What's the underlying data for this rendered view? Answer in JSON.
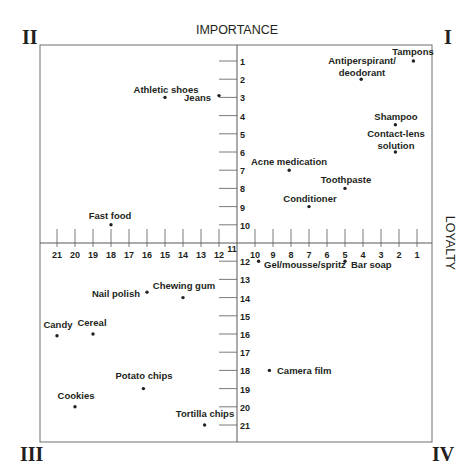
{
  "chart_data": {
    "type": "scatter",
    "title": "",
    "quadrant_labels": [
      "I",
      "II",
      "III",
      "IV"
    ],
    "ylabel": "IMPORTANCE",
    "xlabel": "LOYALTY",
    "x_axis": {
      "name": "LOYALTY",
      "ticks_right": [
        10,
        9,
        8,
        7,
        6,
        5,
        4,
        3,
        2,
        1
      ],
      "ticks_left": [
        21,
        20,
        19,
        18,
        17,
        16,
        15,
        14,
        13,
        12
      ],
      "center_label": "11",
      "direction": "higher loyalty toward right (1 = highest)"
    },
    "y_axis": {
      "name": "IMPORTANCE",
      "ticks_top": [
        1,
        2,
        3,
        4,
        5,
        6,
        7,
        8,
        9,
        10
      ],
      "ticks_bottom": [
        12,
        13,
        14,
        15,
        16,
        17,
        18,
        19,
        20,
        21
      ],
      "center_label": "11",
      "direction": "higher importance toward top (1 = highest)"
    },
    "grid": false,
    "legend": null,
    "points": [
      {
        "label": "Tampons",
        "loyalty": 1.2,
        "importance": 1,
        "quadrant": "I"
      },
      {
        "label": "Antiperspirant/ deodorant",
        "loyalty": 4.1,
        "importance": 2,
        "quadrant": "I"
      },
      {
        "label": "Shampoo",
        "loyalty": 2.2,
        "importance": 4.5,
        "quadrant": "I"
      },
      {
        "label": "Contact-lens solution",
        "loyalty": 2.2,
        "importance": 6,
        "quadrant": "I"
      },
      {
        "label": "Acne medication",
        "loyalty": 8.1,
        "importance": 7,
        "quadrant": "I"
      },
      {
        "label": "Toothpaste",
        "loyalty": 5,
        "importance": 8,
        "quadrant": "I"
      },
      {
        "label": "Conditioner",
        "loyalty": 7,
        "importance": 9,
        "quadrant": "I"
      },
      {
        "label": "Athletic shoes",
        "loyalty": 15,
        "importance": 3,
        "quadrant": "II"
      },
      {
        "label": "Jeans",
        "loyalty": 12,
        "importance": 2.9,
        "quadrant": "II"
      },
      {
        "label": "Fast food",
        "loyalty": 18,
        "importance": 10,
        "quadrant": "II"
      },
      {
        "label": "Nail polish",
        "loyalty": 16,
        "importance": 13.7,
        "quadrant": "III"
      },
      {
        "label": "Chewing gum",
        "loyalty": 14,
        "importance": 14,
        "quadrant": "III"
      },
      {
        "label": "Candy",
        "loyalty": 21,
        "importance": 16.1,
        "quadrant": "III"
      },
      {
        "label": "Cereal",
        "loyalty": 19,
        "importance": 16,
        "quadrant": "III"
      },
      {
        "label": "Potato chips",
        "loyalty": 16.2,
        "importance": 19,
        "quadrant": "III"
      },
      {
        "label": "Cookies",
        "loyalty": 20,
        "importance": 20,
        "quadrant": "III"
      },
      {
        "label": "Tortilla chips",
        "loyalty": 12.8,
        "importance": 21,
        "quadrant": "III"
      },
      {
        "label": "Gel/mousse/spritz",
        "loyalty": 9.8,
        "importance": 12,
        "quadrant": "IV"
      },
      {
        "label": "Bar soap",
        "loyalty": 5,
        "importance": 12,
        "quadrant": "IV"
      },
      {
        "label": "Camera film",
        "loyalty": 9.2,
        "importance": 18,
        "quadrant": "IV"
      }
    ]
  },
  "render": {
    "frame": {
      "left": 40,
      "top": 45,
      "right": 432,
      "bottom": 442
    },
    "origin": {
      "x": 237,
      "y": 243
    },
    "step_x": 18,
    "step_y": 18.2,
    "quadrants": [
      {
        "text": "I",
        "x": 444,
        "y": 44
      },
      {
        "text": "II",
        "x": 22,
        "y": 44
      },
      {
        "text": "III",
        "x": 20,
        "y": 461
      },
      {
        "text": "IV",
        "x": 432,
        "y": 461
      }
    ],
    "axis_titles": {
      "importance": {
        "text": "IMPORTANCE",
        "x": 237,
        "y": 34
      },
      "loyalty": {
        "text": "LOYALTY",
        "x": 446,
        "y": 243
      }
    },
    "labels": [
      {
        "lines": [
          "Tampons"
        ],
        "x": 413,
        "y": 55,
        "anchor": "middle"
      },
      {
        "lines": [
          "Antiperspirant/",
          "deodorant"
        ],
        "x": 362,
        "y": 64,
        "anchor": "middle"
      },
      {
        "lines": [
          "Shampoo"
        ],
        "x": 396,
        "y": 120,
        "anchor": "middle"
      },
      {
        "lines": [
          "Contact-lens",
          "solution"
        ],
        "x": 396,
        "y": 137,
        "anchor": "middle"
      },
      {
        "lines": [
          "Acne medication"
        ],
        "x": 289,
        "y": 165,
        "anchor": "middle"
      },
      {
        "lines": [
          "Toothpaste"
        ],
        "x": 346,
        "y": 183,
        "anchor": "middle"
      },
      {
        "lines": [
          "Conditioner"
        ],
        "x": 310,
        "y": 202,
        "anchor": "middle"
      },
      {
        "lines": [
          "Athletic shoes"
        ],
        "x": 166,
        "y": 93,
        "anchor": "middle"
      },
      {
        "lines": [
          "Jeans"
        ],
        "x": 211,
        "y": 101,
        "anchor": "end"
      },
      {
        "lines": [
          "Fast food"
        ],
        "x": 110,
        "y": 219,
        "anchor": "middle"
      },
      {
        "lines": [
          "Gel/mousse/spritz"
        ],
        "x": 264,
        "y": 268,
        "anchor": "start"
      },
      {
        "lines": [
          "Bar soap"
        ],
        "x": 351,
        "y": 268,
        "anchor": "start"
      },
      {
        "lines": [
          "Nail polish"
        ],
        "x": 140,
        "y": 297,
        "anchor": "end"
      },
      {
        "lines": [
          "Chewing gum"
        ],
        "x": 184,
        "y": 289,
        "anchor": "middle"
      },
      {
        "lines": [
          "Candy"
        ],
        "x": 58,
        "y": 328,
        "anchor": "middle"
      },
      {
        "lines": [
          "Cereal"
        ],
        "x": 92,
        "y": 326,
        "anchor": "middle"
      },
      {
        "lines": [
          "Camera film"
        ],
        "x": 277,
        "y": 374,
        "anchor": "start"
      },
      {
        "lines": [
          "Potato chips"
        ],
        "x": 144,
        "y": 379,
        "anchor": "middle"
      },
      {
        "lines": [
          "Cookies"
        ],
        "x": 76,
        "y": 399,
        "anchor": "middle"
      },
      {
        "lines": [
          "Tortilla chips"
        ],
        "x": 205,
        "y": 417,
        "anchor": "middle"
      }
    ],
    "colors": {
      "ink": "#231f20",
      "frame": "#6d6e71",
      "axis": "#58595b"
    }
  }
}
